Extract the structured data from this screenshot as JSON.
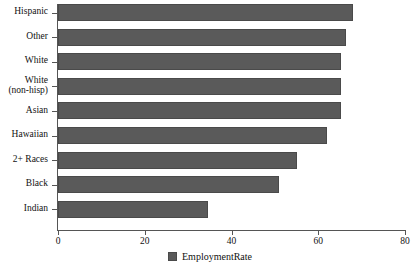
{
  "chart_data": {
    "type": "bar",
    "orientation": "horizontal",
    "title": "",
    "xlabel": "",
    "ylabel": "",
    "xlim": [
      0,
      80
    ],
    "xticks": [
      0,
      20,
      40,
      60,
      80
    ],
    "grid": false,
    "legend_position": "bottom-center",
    "categories": [
      "Hispanic",
      "Other",
      "White",
      "White\n(non-hisp)",
      "Asian",
      "Hawaiian",
      "2+ Races",
      "Black",
      "Indian"
    ],
    "series": [
      {
        "name": "EmploymentRate",
        "color": "#5a5a5a",
        "values": [
          68,
          66.5,
          65.2,
          65.2,
          65.2,
          62,
          55,
          51,
          34.5
        ]
      }
    ]
  },
  "legend": {
    "entries": [
      {
        "label": "EmploymentRate",
        "swatch": "legend-swatch-icon"
      }
    ]
  },
  "axis": {
    "x_tick_labels": [
      "0",
      "20",
      "40",
      "60",
      "80"
    ]
  },
  "colors": {
    "bar_fill": "#5a5a5a",
    "bar_stroke": "#4a4a4a",
    "axis": "#555555",
    "text": "#111111",
    "background": "#ffffff"
  }
}
